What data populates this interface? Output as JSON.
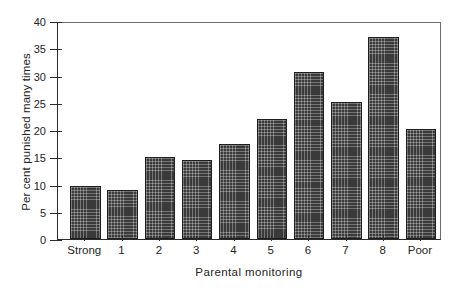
{
  "chart_data": {
    "type": "bar",
    "title": "",
    "xlabel": "Parental monitoring",
    "ylabel": "Per cent punished many times",
    "categories": [
      "Strong",
      "1",
      "2",
      "3",
      "4",
      "5",
      "6",
      "7",
      "8",
      "Poor"
    ],
    "values": [
      9.7,
      9.0,
      15.1,
      14.5,
      17.4,
      22.0,
      30.6,
      25.1,
      37.1,
      20.1
    ],
    "ylim": [
      0,
      40
    ],
    "yticks": [
      0,
      5,
      10,
      15,
      20,
      25,
      30,
      35,
      40
    ],
    "ytick_labels": [
      "0",
      "5",
      "10",
      "15",
      "20",
      "25",
      "30",
      "35",
      "40"
    ],
    "grid": false,
    "legend": null,
    "series_name": "Per cent punished many times",
    "bar_fill": "#3a3a3a",
    "bar_pattern": "crosshatch",
    "bar_edge_color": "#1e1e1e",
    "axis_color": "#2b2b2b",
    "background": "#ffffff"
  }
}
